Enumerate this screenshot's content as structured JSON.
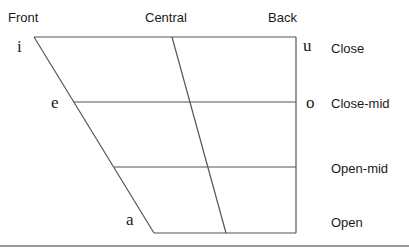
{
  "columns": {
    "front": "Front",
    "central": "Central",
    "back": "Back"
  },
  "rows": {
    "close": "Close",
    "close_mid": "Close-mid",
    "open_mid": "Open-mid",
    "open": "Open"
  },
  "vowels": {
    "i": "i",
    "e": "e",
    "a": "a",
    "u": "u",
    "o": "o"
  },
  "colors": {
    "line": "#555555",
    "text": "#1a1a1a"
  }
}
